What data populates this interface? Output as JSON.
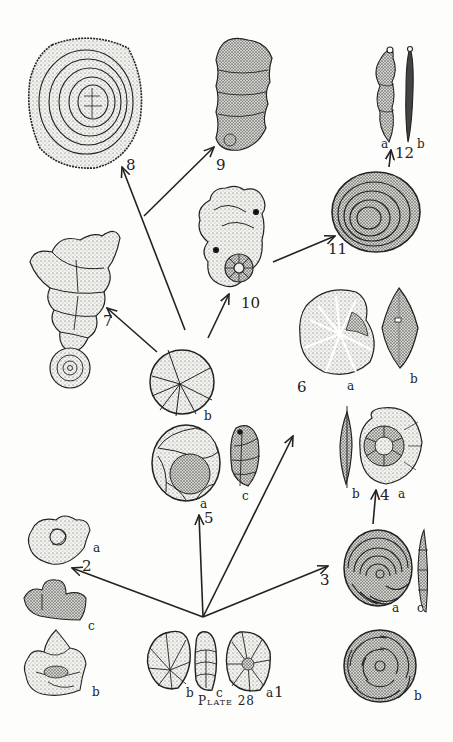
{
  "plate": {
    "caption": "Plate 28",
    "ink_color": "#222222",
    "paper_color": "#fdfdfb"
  },
  "specimens": [
    {
      "id": "1",
      "label": "1",
      "views": [
        "a",
        "b",
        "c"
      ],
      "form": "planispiral-rounded"
    },
    {
      "id": "2",
      "label": "2",
      "views": [
        "a",
        "b",
        "c"
      ],
      "form": "irregular-lobate"
    },
    {
      "id": "3",
      "label": "3",
      "views": [
        "a",
        "b",
        "c"
      ],
      "form": "planispiral-evolute"
    },
    {
      "id": "4",
      "label": "4",
      "views": [
        "a",
        "b"
      ],
      "form": "planispiral-compressed"
    },
    {
      "id": "5",
      "label": "5",
      "views": [
        "a",
        "b",
        "c"
      ],
      "form": "involute-planispiral"
    },
    {
      "id": "6",
      "label": "6",
      "views": [
        "a",
        "b"
      ],
      "form": "lenticular"
    },
    {
      "id": "7",
      "label": "7",
      "views": [],
      "form": "uncoiling-biserial"
    },
    {
      "id": "8",
      "label": "8",
      "views": [],
      "form": "discoidal-annular"
    },
    {
      "id": "9",
      "label": "9",
      "views": [],
      "form": "uniserial-uncoiled"
    },
    {
      "id": "10",
      "label": "10",
      "views": [],
      "form": "streptospiral"
    },
    {
      "id": "11",
      "label": "11",
      "views": [],
      "form": "annular-elliptical"
    },
    {
      "id": "12",
      "label": "12",
      "views": [
        "a",
        "b"
      ],
      "form": "uniserial-elongate"
    }
  ],
  "labels": {
    "n1": "1",
    "n2": "2",
    "n3": "3",
    "n4": "4",
    "n5": "5",
    "n6": "6",
    "n7": "7",
    "n8": "8",
    "n9": "9",
    "n10": "10",
    "n11": "11",
    "n12": "12",
    "a": "a",
    "b": "b",
    "c": "c"
  },
  "arrows": [
    {
      "from": "1",
      "to": "2"
    },
    {
      "from": "1",
      "to": "5"
    },
    {
      "from": "1",
      "to": "6"
    },
    {
      "from": "1",
      "to": "3"
    },
    {
      "from": "3",
      "to": "4"
    },
    {
      "from": "5",
      "to": "7"
    },
    {
      "from": "5",
      "to": "8"
    },
    {
      "from": "5",
      "to": "9"
    },
    {
      "from": "5",
      "to": "10"
    },
    {
      "from": "10",
      "to": "11"
    },
    {
      "from": "11",
      "to": "12"
    }
  ]
}
